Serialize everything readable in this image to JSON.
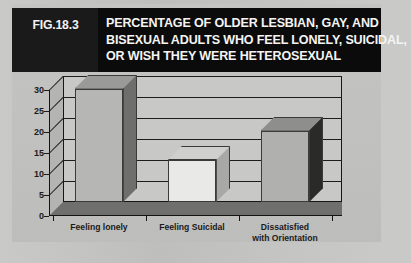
{
  "figure": {
    "number": "FIG.18.3",
    "title_lines": [
      "PERCENTAGE OF OLDER LESBIAN, GAY, AND",
      "BISEXUAL ADULTS WHO FEEL LONELY, SUICIDAL,",
      "OR WISH THEY WERE HETEROSEXUAL"
    ]
  },
  "chart_data": {
    "type": "bar",
    "title": "PERCENTAGE OF OLDER LESBIAN, GAY, AND BISEXUAL ADULTS WHO FEEL LONELY, SUICIDAL, OR WISH THEY WERE HETEROSEXUAL",
    "categories": [
      "Feeling lonely",
      "Feeling Suicidal",
      "Dissatisfied with Orientation"
    ],
    "category_lines": [
      [
        "Feeling lonely"
      ],
      [
        "Feeling Suicidal"
      ],
      [
        "Dissatisfied",
        "with Orientation"
      ]
    ],
    "values": [
      27,
      10,
      17
    ],
    "xlabel": "",
    "ylabel": "",
    "ylim": [
      0,
      30
    ],
    "yticks": [
      0,
      5,
      10,
      15,
      20,
      25,
      30
    ],
    "ytick_labels": [
      "0",
      "5",
      "10",
      "15",
      "20",
      "25",
      "30"
    ],
    "grid": true,
    "legend": false,
    "style": "3d-column",
    "bar_colors": [
      "#b6b6b4",
      "#e9e9e7",
      "#b0b0ae"
    ],
    "bar_top_colors": [
      "#9a9a98",
      "#cfcfcd",
      "#8e8e8c"
    ],
    "bar_side_colors": [
      "#6e6e6c",
      "#a8a8a6",
      "#2a2a28"
    ]
  },
  "colors": {
    "banner_background": "#0b0b0b",
    "banner_text": "#f4f4f4",
    "panel_background": "#c2c2c0",
    "plot_background": "#c8c8c6",
    "axis": "#141414",
    "gridline": "#1d1d1d",
    "floor": "#6f6f6d"
  }
}
